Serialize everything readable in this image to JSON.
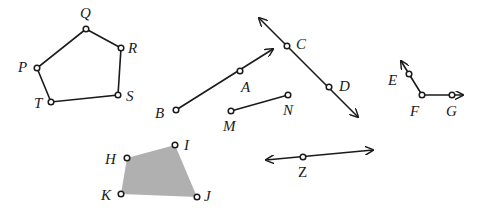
{
  "figures": {
    "pentagon": {
      "name": "Pentagon PQRST",
      "vertices": [
        {
          "label": "Q",
          "x": 86,
          "y": 29,
          "lx": 80,
          "ly": 18
        },
        {
          "label": "R",
          "x": 121,
          "y": 48,
          "lx": 128,
          "ly": 53
        },
        {
          "label": "S",
          "x": 118,
          "y": 95,
          "lx": 126,
          "ly": 101
        },
        {
          "label": "T",
          "x": 51,
          "y": 102,
          "lx": 34,
          "ly": 108
        },
        {
          "label": "P",
          "x": 37,
          "y": 68,
          "lx": 18,
          "ly": 72
        }
      ]
    },
    "ray_BA": {
      "name": "Ray BA",
      "points": [
        {
          "label": "B",
          "x": 176,
          "y": 110,
          "lx": 155,
          "ly": 118
        },
        {
          "label": "A",
          "x": 240,
          "y": 71,
          "lx": 241,
          "ly": 92
        }
      ],
      "arrow_end": {
        "x": 273,
        "y": 49
      }
    },
    "line_CD": {
      "name": "Line CD",
      "points": [
        {
          "label": "C",
          "x": 287,
          "y": 46,
          "lx": 296,
          "ly": 49
        },
        {
          "label": "D",
          "x": 329,
          "y": 87,
          "lx": 339,
          "ly": 91
        }
      ],
      "arrow_start": {
        "x": 259,
        "y": 18
      },
      "arrow_end": {
        "x": 358,
        "y": 117
      }
    },
    "segment_MN": {
      "name": "Segment MN",
      "points": [
        {
          "label": "M",
          "x": 231,
          "y": 111,
          "lx": 223,
          "ly": 131
        },
        {
          "label": "N",
          "x": 288,
          "y": 95,
          "lx": 283,
          "ly": 115
        }
      ]
    },
    "angle_EFG": {
      "name": "Angle EFG",
      "points": [
        {
          "label": "E",
          "x": 409,
          "y": 74,
          "lx": 388,
          "ly": 85
        },
        {
          "label": "F",
          "x": 422,
          "y": 95,
          "lx": 410,
          "ly": 116
        },
        {
          "label": "G",
          "x": 452,
          "y": 95,
          "lx": 446,
          "ly": 116
        }
      ],
      "arrow_E": {
        "x": 401,
        "y": 61
      },
      "arrow_G": {
        "x": 463,
        "y": 95
      }
    },
    "quadrilateral": {
      "name": "Quadrilateral HIJK (shaded)",
      "fill": "#b0b0b0",
      "vertices": [
        {
          "label": "H",
          "x": 127,
          "y": 158,
          "lx": 105,
          "ly": 164
        },
        {
          "label": "I",
          "x": 175,
          "y": 145,
          "lx": 184,
          "ly": 150
        },
        {
          "label": "J",
          "x": 197,
          "y": 197,
          "lx": 204,
          "ly": 201
        },
        {
          "label": "K",
          "x": 121,
          "y": 194,
          "lx": 101,
          "ly": 200
        }
      ]
    },
    "line_Z": {
      "name": "Line through Z",
      "points": [
        {
          "label": "Z",
          "x": 303,
          "y": 157,
          "lx": 298,
          "ly": 177
        }
      ],
      "arrow_start": {
        "x": 266,
        "y": 160
      },
      "arrow_end": {
        "x": 373,
        "y": 150
      }
    }
  },
  "colors": {
    "stroke": "#1a1a1a",
    "shade": "#b0b0b0",
    "background": "#ffffff"
  }
}
